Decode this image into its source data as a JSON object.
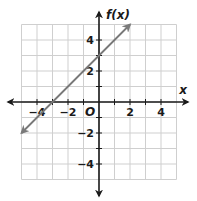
{
  "chart_data": {
    "type": "line",
    "title": "",
    "xlabel": "x",
    "ylabel": "f(x)",
    "origin_label": "O",
    "xlim": [
      -5,
      5
    ],
    "ylim": [
      -5,
      5
    ],
    "grid": true,
    "x_ticks": [
      -4,
      -2,
      2,
      4
    ],
    "y_ticks": [
      4,
      2,
      -2,
      -4
    ],
    "x_tick_labels": [
      "−4",
      "−2",
      "2",
      "4"
    ],
    "y_tick_labels": [
      "4",
      "2",
      "−2",
      "−4"
    ],
    "series": [
      {
        "name": "f(x) = x + 3",
        "x": [
          -5,
          -3,
          0,
          2
        ],
        "y": [
          -2,
          0,
          3,
          5
        ],
        "arrows": "both",
        "color": "#777777"
      }
    ],
    "colors": {
      "grid": "#cfcfcf",
      "axes": "#1a1a1a",
      "line": "#7a7a7a"
    }
  }
}
